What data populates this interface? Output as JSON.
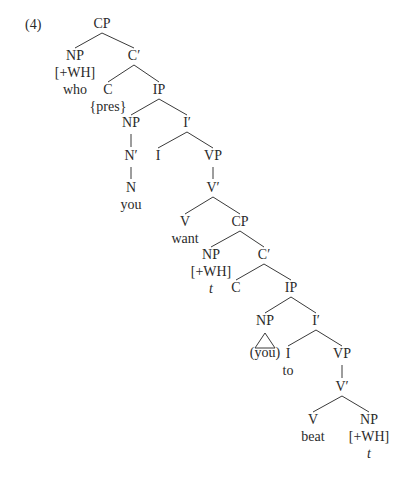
{
  "example_number": "(4)",
  "colors": {
    "text": "#2a2a2a",
    "line": "#3a3a3a",
    "background": "#ffffff"
  },
  "nodes": [
    {
      "id": "cp1",
      "label": "CP",
      "x": 102,
      "y": 28
    },
    {
      "id": "np1",
      "label": "NP",
      "x": 75,
      "y": 60,
      "sub": [
        "[+WH]",
        "who"
      ]
    },
    {
      "id": "cbar1",
      "label": "C′",
      "x": 134,
      "y": 60
    },
    {
      "id": "c1",
      "label": "C",
      "x": 108,
      "y": 94,
      "sub": [
        "{pres}"
      ]
    },
    {
      "id": "ip1",
      "label": "IP",
      "x": 159,
      "y": 94
    },
    {
      "id": "np2",
      "label": "NP",
      "x": 131,
      "y": 127
    },
    {
      "id": "ibar1",
      "label": "I′",
      "x": 187,
      "y": 127
    },
    {
      "id": "nbar1",
      "label": "N′",
      "x": 131,
      "y": 160
    },
    {
      "id": "i1",
      "label": "I",
      "x": 158,
      "y": 160
    },
    {
      "id": "vp1",
      "label": "VP",
      "x": 213,
      "y": 160
    },
    {
      "id": "n1",
      "label": "N",
      "x": 131,
      "y": 192,
      "sub": [
        "you"
      ]
    },
    {
      "id": "vbar1",
      "label": "V′",
      "x": 213,
      "y": 192
    },
    {
      "id": "v1",
      "label": "V",
      "x": 185,
      "y": 226,
      "sub": [
        "want"
      ]
    },
    {
      "id": "cp2",
      "label": "CP",
      "x": 240,
      "y": 226
    },
    {
      "id": "np3",
      "label": "NP",
      "x": 211,
      "y": 259,
      "sub": [
        "[+WH]"
      ],
      "trace": "t"
    },
    {
      "id": "cbar2",
      "label": "C′",
      "x": 264,
      "y": 259
    },
    {
      "id": "c2",
      "label": "C",
      "x": 236,
      "y": 292
    },
    {
      "id": "ip2",
      "label": "IP",
      "x": 291,
      "y": 292
    },
    {
      "id": "np4",
      "label": "NP",
      "x": 265,
      "y": 325,
      "triangle": true,
      "sub": [
        "(you)"
      ]
    },
    {
      "id": "ibar2",
      "label": "I′",
      "x": 316,
      "y": 325
    },
    {
      "id": "i2",
      "label": "I",
      "x": 288,
      "y": 358,
      "sub": [
        "to"
      ]
    },
    {
      "id": "vp2",
      "label": "VP",
      "x": 342,
      "y": 358
    },
    {
      "id": "vbar2",
      "label": "V′",
      "x": 342,
      "y": 391
    },
    {
      "id": "v2",
      "label": "V",
      "x": 313,
      "y": 424,
      "sub": [
        "beat"
      ]
    },
    {
      "id": "np5",
      "label": "NP",
      "x": 369,
      "y": 424,
      "sub": [
        "[+WH]"
      ],
      "trace": "t"
    }
  ],
  "edges": [
    [
      "cp1",
      "np1"
    ],
    [
      "cp1",
      "cbar1"
    ],
    [
      "cbar1",
      "c1"
    ],
    [
      "cbar1",
      "ip1"
    ],
    [
      "ip1",
      "np2"
    ],
    [
      "ip1",
      "ibar1"
    ],
    [
      "np2",
      "nbar1"
    ],
    [
      "nbar1",
      "n1"
    ],
    [
      "ibar1",
      "i1"
    ],
    [
      "ibar1",
      "vp1"
    ],
    [
      "vp1",
      "vbar1"
    ],
    [
      "vbar1",
      "v1"
    ],
    [
      "vbar1",
      "cp2"
    ],
    [
      "cp2",
      "np3"
    ],
    [
      "cp2",
      "cbar2"
    ],
    [
      "cbar2",
      "c2"
    ],
    [
      "cbar2",
      "ip2"
    ],
    [
      "ip2",
      "np4"
    ],
    [
      "ip2",
      "ibar2"
    ],
    [
      "ibar2",
      "i2"
    ],
    [
      "ibar2",
      "vp2"
    ],
    [
      "vp2",
      "vbar2"
    ],
    [
      "vbar2",
      "v2"
    ],
    [
      "vbar2",
      "np5"
    ]
  ]
}
